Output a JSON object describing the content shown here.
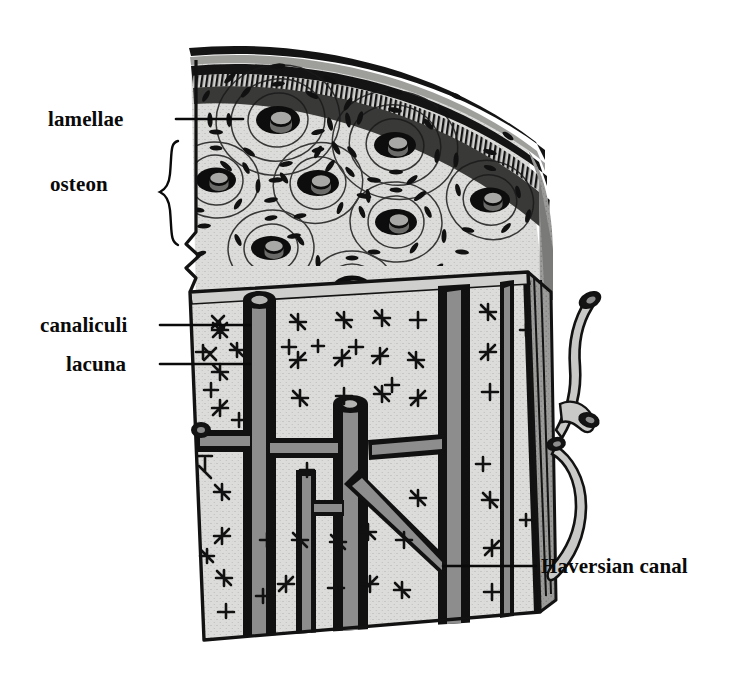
{
  "figure": {
    "background_color": "#ffffff",
    "ink_color": "#0a0a0a",
    "bone_matrix_color": "#d8d8d6",
    "canal_gray": "#8d8d8d",
    "shadow_gray": "#6a6a6a"
  },
  "labels": [
    {
      "id": "lamellae",
      "text": "lamellae",
      "side": "left",
      "leader": {
        "x1": 176,
        "y1": 119,
        "x2": 243,
        "y2": 119
      }
    },
    {
      "id": "osteon",
      "text": "osteon",
      "side": "left",
      "bracket": {
        "x": 170,
        "y_top": 141,
        "y_bottom": 245
      }
    },
    {
      "id": "canaliculi",
      "text": "canaliculi",
      "side": "left",
      "leader": {
        "x1": 160,
        "y1": 325,
        "x2": 250,
        "y2": 325
      }
    },
    {
      "id": "lacuna",
      "text": "lacuna",
      "side": "left",
      "leader": {
        "x1": 160,
        "y1": 364,
        "x2": 250,
        "y2": 364
      }
    },
    {
      "id": "haversian-canal",
      "text": "Haversian canal",
      "side": "right",
      "leader": {
        "x1": 443,
        "y1": 566,
        "x2": 536,
        "y2": 566
      }
    }
  ],
  "structures": {
    "periosteum_layers": 3,
    "osteon_count": 8,
    "osteons": [
      {
        "cx": 278,
        "cy": 120,
        "r": 17
      },
      {
        "cx": 395,
        "cy": 145,
        "r": 16
      },
      {
        "cx": 216,
        "cy": 180,
        "r": 15
      },
      {
        "cx": 318,
        "cy": 183,
        "r": 16
      },
      {
        "cx": 490,
        "cy": 200,
        "r": 15
      },
      {
        "cx": 396,
        "cy": 222,
        "r": 16
      },
      {
        "cx": 271,
        "cy": 248,
        "r": 15
      },
      {
        "cx": 352,
        "cy": 287,
        "r": 14
      }
    ],
    "longitudinal_canals": 5,
    "volkmann_branches": 3,
    "vessel_stub_count": 3
  }
}
